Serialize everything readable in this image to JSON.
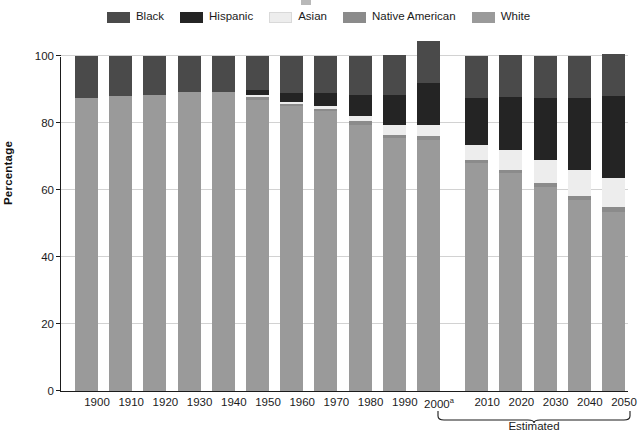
{
  "legend": {
    "items": [
      {
        "label": "Black",
        "color": "#4a4a4a",
        "key": "black"
      },
      {
        "label": "Hispanic",
        "color": "#242424",
        "key": "hispanic"
      },
      {
        "label": "Asian",
        "color": "#ededed",
        "key": "asian"
      },
      {
        "label": "Native American",
        "color": "#8b8b8b",
        "key": "native_american"
      },
      {
        "label": "White",
        "color": "#9a9a9a",
        "key": "white"
      }
    ]
  },
  "axes": {
    "ylabel": "Percentage",
    "yticks": [
      "0",
      "20",
      "40",
      "60",
      "80",
      "100"
    ],
    "ytick_values": [
      0,
      20,
      40,
      60,
      80,
      100
    ],
    "ymin": 0,
    "ymax": 100,
    "grid": true
  },
  "annotations": {
    "estimated_label": "Estimated",
    "estimated_span": [
      "2010",
      "2050"
    ],
    "footnote_marker": "a"
  },
  "chart_data": {
    "type": "bar",
    "subtype": "stacked-vertical",
    "title": "",
    "xlabel": "",
    "ylabel": "Percentage",
    "ylim": [
      0,
      100
    ],
    "grid": true,
    "legend_position": "top-center",
    "categories": [
      "1900",
      "1910",
      "1920",
      "1930",
      "1940",
      "1950",
      "1960",
      "1970",
      "1980",
      "1990",
      "2000",
      "2010",
      "2020",
      "2030",
      "2040",
      "2050"
    ],
    "category_labels": [
      "1900",
      "1910",
      "1920",
      "1930",
      "1940",
      "1950",
      "1960",
      "1970",
      "1980",
      "1990",
      "2000ᵃ",
      "2010",
      "2020",
      "2030",
      "2040",
      "2050"
    ],
    "stack_order_bottom_to_top": [
      "White",
      "Native American",
      "Asian",
      "Hispanic",
      "Black"
    ],
    "series": [
      {
        "name": "White",
        "color": "#9a9a9a",
        "values": [
          87.5,
          88.0,
          88.5,
          89.3,
          89.3,
          87.0,
          85.0,
          83.5,
          79.5,
          75.5,
          75.0,
          68.0,
          65.0,
          61.0,
          57.0,
          53.5
        ]
      },
      {
        "name": "Native American",
        "color": "#8b8b8b",
        "values": [
          0.0,
          0.0,
          0.0,
          0.0,
          0.0,
          0.8,
          0.8,
          0.8,
          1.0,
          1.0,
          1.0,
          1.0,
          1.0,
          1.2,
          1.2,
          1.5
        ]
      },
      {
        "name": "Asian",
        "color": "#ededed",
        "values": [
          0.0,
          0.0,
          0.0,
          0.0,
          0.0,
          0.5,
          0.6,
          0.7,
          1.5,
          2.8,
          3.5,
          4.5,
          5.8,
          6.8,
          7.8,
          8.5
        ]
      },
      {
        "name": "Hispanic",
        "color": "#242424",
        "values": [
          0.0,
          0.0,
          0.0,
          0.0,
          0.0,
          1.6,
          2.6,
          4.0,
          6.5,
          9.0,
          12.5,
          14.0,
          16.0,
          18.5,
          21.5,
          24.5
        ]
      },
      {
        "name": "Black",
        "color": "#4a4a4a",
        "values": [
          12.5,
          12.0,
          11.5,
          10.7,
          10.7,
          10.1,
          11.0,
          11.0,
          11.5,
          12.0,
          12.5,
          12.5,
          12.5,
          12.5,
          12.5,
          12.5
        ]
      }
    ],
    "totals": [
      100.0,
      100.0,
      100.0,
      100.0,
      100.0,
      100.0,
      100.0,
      100.0,
      100.0,
      100.3,
      104.5,
      100.0,
      100.3,
      100.0,
      100.0,
      100.5
    ]
  },
  "colors": {
    "axis": "#1b1b1b",
    "grid": "#d2d2d2",
    "background": "#ffffff"
  }
}
